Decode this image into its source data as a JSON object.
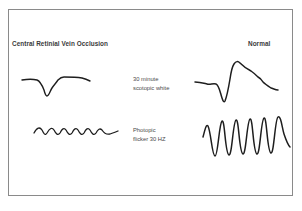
{
  "figure": {
    "columns": {
      "left_title": "Central Retinial Vein Occlusion",
      "right_title": "Normal"
    },
    "rows": [
      {
        "id": "scotopic",
        "label_line1": "30 minute",
        "label_line2": "scotopic white"
      },
      {
        "id": "flicker",
        "label_line1": "Photopic",
        "label_line2": "flicker 30 HZ"
      }
    ],
    "colors": {
      "frame": "#8a8a8a",
      "trace": "#1e1e1e",
      "title_text": "#3a3a3a",
      "label_text": "#4a4a4a",
      "background": "#ffffff"
    },
    "traces": {
      "crvo_scotopic": "M22,80 C28,79 33,79 37,80 C40,81 42,85 44,90 C45,94 46,96 47,96 C49,96 50,91 52,88 C54,85 56,83 58,80 C60,78 61,77 64,77 C70,77 76,77 82,78 C86,79 88,80 90,81",
      "normal_scotopic": "M195,82 C200,82 203,83 207,84 C210,85 213,83 216,84 C219,85 220,92 222,98 C223,101 224,103 225,101 C227,96 229,85 230,79 C231,72 232,67 234,64 C236,61 238,61 240,63 C243,66 247,69 251,71 C254,73 256,75 258,77 C260,78 262,80 263,82 C265,84 268,86 271,88 C274,89 276,90 278,90",
      "crvo_flicker": "M34,133 C37,127 40,127 42,130 C44,134 45,136 47,133 C50,128 52,127 54,130 C56,134 58,136 60,133 C62,129 64,127 66,130 C68,134 70,136 72,133 C74,129 76,127 78,130 C80,134 82,136 84,133 C86,129 88,127 90,130 C92,134 94,136 96,133 C98,129 100,128 102,130 C104,133 106,135 110,134 C113,133 116,132 118,131",
      "normal_flicker": "M203,137 C205,130 206,124 208,126 C211,132 212,156 215,156 C218,156 219,124 222,121 C225,119 225,154 229,155 C232,156 233,122 236,120 C239,118 239,153 243,154 C246,155 247,121 250,119 C253,117 253,153 257,154 C260,155 261,120 264,118 C267,116 267,152 271,153 C274,154 275,119 278,117 C281,115 282,128 284,134 C286,140 288,145 290,147"
    }
  }
}
